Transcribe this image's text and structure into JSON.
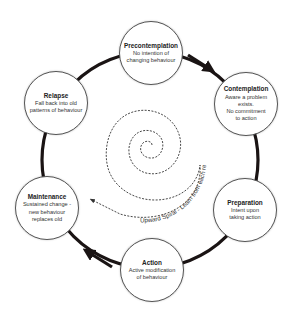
{
  "diagram": {
    "type": "cycle",
    "ring_color": "#1a1414",
    "stages": [
      {
        "id": "precontemplation",
        "title": "Precontemplation",
        "desc": [
          "No intention of",
          "changing behaviour"
        ]
      },
      {
        "id": "contemplation",
        "title": "Contemplation",
        "desc": [
          "Aware a problem",
          "exists.",
          "No commitment",
          "to action"
        ]
      },
      {
        "id": "preparation",
        "title": "Preparation",
        "desc": [
          "Intent upon",
          "taking action"
        ]
      },
      {
        "id": "action",
        "title": "Action",
        "desc": [
          "Active modification",
          "of behaviour"
        ]
      },
      {
        "id": "maintenance",
        "title": "Maintenance",
        "desc": [
          "Sustained change -",
          "new behaviour",
          "replaces old"
        ]
      },
      {
        "id": "relapse",
        "title": "Relapse",
        "desc": [
          "Fall back into old",
          "patterns of behaviour"
        ]
      }
    ],
    "spiral_label": "Upward Spiral - Learn from each relapse",
    "edges": [
      {
        "from": "precontemplation",
        "to": "contemplation",
        "arrow": true
      },
      {
        "from": "contemplation",
        "to": "preparation",
        "arrow": false
      },
      {
        "from": "preparation",
        "to": "action",
        "arrow": false
      },
      {
        "from": "action",
        "to": "maintenance",
        "arrow": true
      },
      {
        "from": "maintenance",
        "to": "relapse",
        "arrow": false
      },
      {
        "from": "relapse",
        "to": "precontemplation",
        "arrow": false
      }
    ]
  }
}
